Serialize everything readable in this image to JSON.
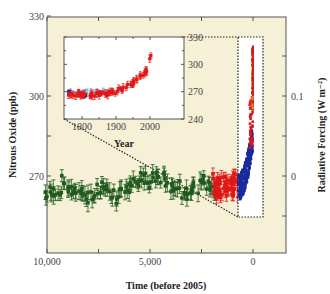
{
  "chart_data": {
    "type": "scatter",
    "title": "",
    "xlabel": "Time (before 2005)",
    "ylabel": "Nitrous Oxide (ppb)",
    "y2label": "Radiative Forcing (W m⁻²)",
    "xlim": [
      10000,
      -500
    ],
    "ylim": [
      261,
      330
    ],
    "y2lim": [
      -0.03,
      0.14
    ],
    "xticks": [
      10000,
      7500,
      5000,
      2500,
      0
    ],
    "xtick_labels": [
      "10,000",
      "",
      "5,000",
      "",
      "0"
    ],
    "yticks": [
      330,
      315,
      300,
      285,
      270
    ],
    "ytick_labels": [
      "330",
      "",
      "300",
      "",
      "270"
    ],
    "y2ticks": [
      0.15,
      0.1,
      0.05,
      0,
      -0.05
    ],
    "y2tick_labels": [
      "",
      "0.1",
      "",
      "0",
      ""
    ],
    "grid": false,
    "legend": "none",
    "background": "#f5f0d6",
    "series": [
      {
        "name": "Ice core (early Holocene)",
        "color": "#1f5a1f",
        "marker": "square",
        "error_bars": true,
        "x": [
          10000,
          9800,
          9600,
          9400,
          9200,
          9000,
          8800,
          8600,
          8400,
          8200,
          8000,
          7800,
          7600,
          7400,
          7200,
          7000,
          6800,
          6600,
          6400,
          6200,
          6000,
          5800,
          5600,
          5400,
          5200,
          5000,
          4800,
          4600,
          4400,
          4200,
          4000,
          3800,
          3600,
          3400,
          3200,
          3000,
          2800,
          2600,
          2400,
          2200,
          2000,
          1800
        ],
        "y": [
          262,
          265,
          263,
          264,
          268,
          266,
          265,
          264,
          263,
          264,
          262,
          263,
          265,
          266,
          267,
          265,
          264,
          262,
          263,
          264,
          266,
          267,
          268,
          270,
          269,
          268,
          270,
          271,
          269,
          267,
          266,
          265,
          266,
          264,
          263,
          265,
          267,
          266,
          268,
          267,
          266,
          265
        ]
      },
      {
        "name": "Ice core (late Holocene, red)",
        "color": "#e01818",
        "marker": "square",
        "error_bars": true,
        "x": [
          1900,
          1800,
          1700,
          1600,
          1500,
          1400,
          1300,
          1200,
          1100,
          1000,
          900,
          800
        ],
        "y": [
          266,
          264,
          263,
          265,
          264,
          262,
          263,
          264,
          266,
          265,
          268,
          270
        ]
      },
      {
        "name": "Ice core / firn (blue)",
        "color": "#1b2a9c",
        "marker": "circle",
        "error_bars": true,
        "x": [
          800,
          700,
          600,
          500,
          400,
          300,
          250,
          200,
          150,
          100,
          50
        ],
        "y": [
          265,
          264,
          266,
          268,
          270,
          270,
          272,
          276,
          282,
          290,
          300
        ]
      },
      {
        "name": "Modern atmospheric (red/orange)",
        "color": "#e01818",
        "marker": "square",
        "error_bars": false,
        "x": [
          50,
          30,
          20,
          10,
          5,
          0
        ],
        "y": [
          300,
          305,
          310,
          315,
          318,
          320
        ]
      }
    ],
    "inset": {
      "type": "scatter",
      "xlabel": "Year",
      "xlim": [
        1750,
        2010
      ],
      "ylim": [
        240,
        330
      ],
      "xticks": [
        1800,
        1900,
        2000
      ],
      "xtick_labels": [
        "1800",
        "1900",
        "2000"
      ],
      "yticks": [
        240,
        270,
        300,
        330
      ],
      "ytick_labels": [
        "240",
        "270",
        "300",
        "330"
      ],
      "background": "#ffffff",
      "series": [
        {
          "name": "light blue",
          "color": "#8ec5e0",
          "x": [
            1760,
            1780,
            1800,
            1820,
            1840,
            1860
          ],
          "y": [
            270,
            270,
            271,
            270,
            269,
            270
          ]
        },
        {
          "name": "blue",
          "color": "#1b2a9c",
          "x": [
            1760,
            1790,
            1810
          ],
          "y": [
            270,
            268,
            266
          ]
        },
        {
          "name": "red",
          "color": "#e01818",
          "x": [
            1760,
            1800,
            1830,
            1860,
            1880,
            1900,
            1920,
            1940,
            1960,
            1970,
            1980,
            1990,
            2000
          ],
          "y": [
            268,
            266,
            264,
            266,
            270,
            272,
            275,
            278,
            282,
            286,
            292,
            300,
            315
          ]
        }
      ]
    },
    "annotations": [
      "dotted zoom box around recent data (approx. 0–700 years before 2005, 262–330 ppb)",
      "dotted connector lines from zoom box to inset"
    ]
  }
}
